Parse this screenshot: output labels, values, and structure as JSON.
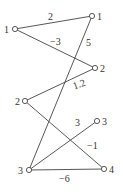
{
  "diagram": {
    "type": "bipartite-graph",
    "left_nodes": [
      {
        "id": "L1",
        "label": "1",
        "x": 15,
        "y": 29
      },
      {
        "id": "L2",
        "label": "2",
        "x": 25,
        "y": 101
      },
      {
        "id": "L3",
        "label": "3",
        "x": 29,
        "y": 170
      }
    ],
    "right_nodes": [
      {
        "id": "R1",
        "label": "1",
        "x": 92,
        "y": 16
      },
      {
        "id": "R2",
        "label": "2",
        "x": 95,
        "y": 68
      },
      {
        "id": "R3",
        "label": "3",
        "x": 97,
        "y": 121
      },
      {
        "id": "R4",
        "label": "4",
        "x": 104,
        "y": 169
      }
    ],
    "edges": [
      {
        "from": "L1",
        "to": "R1",
        "weight": "2"
      },
      {
        "from": "L1",
        "to": "R2",
        "weight": "-3"
      },
      {
        "from": "L3",
        "to": "R1",
        "weight": "5"
      },
      {
        "from": "L2",
        "to": "R2",
        "weight": "1.2"
      },
      {
        "from": "L2",
        "to": "R4",
        "weight": "-1"
      },
      {
        "from": "L3",
        "to": "R3",
        "weight": "3"
      },
      {
        "from": "L3",
        "to": "R4",
        "weight": "-6"
      }
    ]
  }
}
